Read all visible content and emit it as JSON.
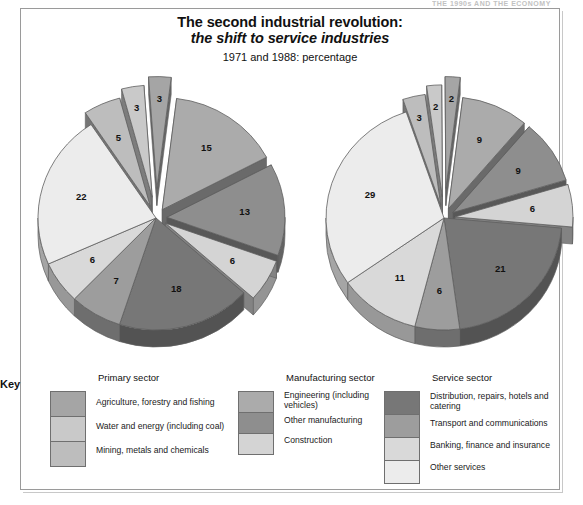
{
  "page": {
    "cutoff_header": "THE 1990s AND THE ECONOMY",
    "background": "#ffffff",
    "frame_color": "#9a9a9a"
  },
  "title": {
    "line1": "The second industrial revolution:",
    "line2": "the shift to service industries",
    "subtitle": "1971 and 1988: percentage"
  },
  "legend": {
    "key_label": "Key",
    "groups": [
      {
        "title": "Primary sector",
        "entries": [
          {
            "label": "Agriculture, forestry and fishing",
            "color": "#a5a5a5"
          },
          {
            "label": "Water and energy (including coal)",
            "color": "#c9c9c9"
          },
          {
            "label": "Mining, metals and chemicals",
            "color": "#bdbdbd"
          }
        ]
      },
      {
        "title": "Manufacturing sector",
        "entries": [
          {
            "label": "Engineering (including vehicles)",
            "color": "#ababab"
          },
          {
            "label": "Other manufacturing",
            "color": "#8e8e8e"
          },
          {
            "label": "Construction",
            "color": "#d4d4d4"
          }
        ]
      },
      {
        "title": "Service sector",
        "entries": [
          {
            "label": "Distribution, repairs, hotels and catering",
            "color": "#777777"
          },
          {
            "label": "Transport and communications",
            "color": "#9d9d9d"
          },
          {
            "label": "Banking, finance and insurance",
            "color": "#d9d9d9"
          },
          {
            "label": "Other services",
            "color": "#ececec"
          }
        ]
      }
    ]
  },
  "chart_data": {
    "type": "pie",
    "title": "The second industrial revolution: the shift to service industries",
    "subtitle": "1971 and 1988: percentage",
    "unit": "percentage",
    "legend_position": "bottom",
    "charts": [
      {
        "name": "1971",
        "year": "1971",
        "categories": [
          "Agriculture, forestry and fishing",
          "Water and energy (including coal)",
          "Mining, metals and chemicals",
          "Engineering (including vehicles)",
          "Other manufacturing",
          "Construction",
          "Distribution, repairs, hotels and catering",
          "Transport and communications",
          "Banking, finance and insurance",
          "Other services"
        ],
        "values": [
          3,
          3,
          5,
          15,
          13,
          6,
          18,
          7,
          6,
          22
        ],
        "labels": [
          "3",
          "3",
          "5",
          "15",
          "13",
          "6",
          "18",
          "7",
          "6",
          "22"
        ],
        "colors": [
          "#a5a5a5",
          "#c9c9c9",
          "#bdbdbd",
          "#ababab",
          "#8e8e8e",
          "#d4d4d4",
          "#777777",
          "#9d9d9d",
          "#d9d9d9",
          "#ececec"
        ]
      },
      {
        "name": "1988",
        "year": "1988",
        "categories": [
          "Agriculture, forestry and fishing",
          "Water and energy (including coal)",
          "Mining, metals and chemicals",
          "Engineering (including vehicles)",
          "Other manufacturing",
          "Construction",
          "Distribution, repairs, hotels and catering",
          "Transport and communications",
          "Banking, finance and insurance",
          "Other services"
        ],
        "values": [
          2,
          2,
          3,
          9,
          9,
          6,
          21,
          6,
          11,
          29
        ],
        "labels": [
          "2",
          "2",
          "3",
          "9",
          "9",
          "6",
          "21",
          "6",
          "11",
          "29"
        ],
        "colors": [
          "#a5a5a5",
          "#c9c9c9",
          "#bdbdbd",
          "#ababab",
          "#8e8e8e",
          "#d4d4d4",
          "#777777",
          "#9d9d9d",
          "#d9d9d9",
          "#ececec"
        ]
      }
    ]
  }
}
